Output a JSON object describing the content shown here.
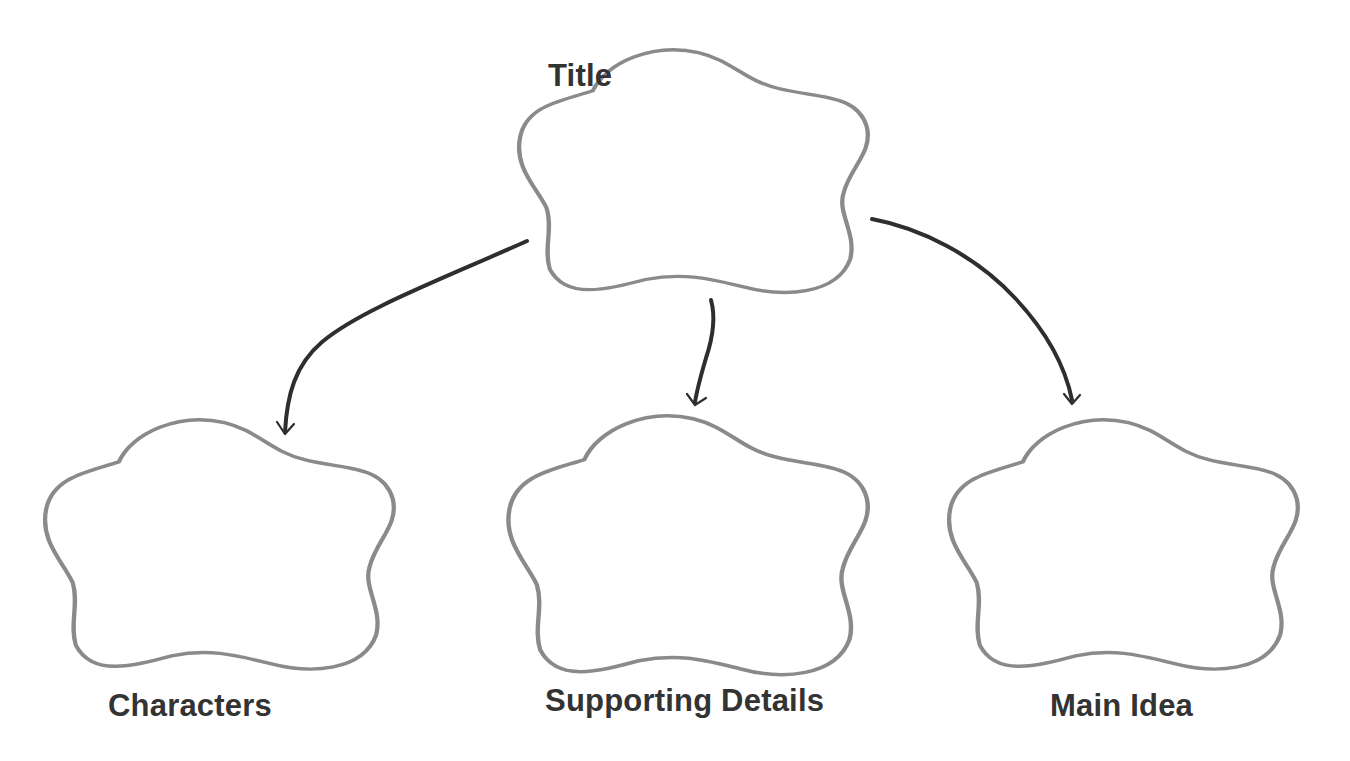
{
  "diagram": {
    "type": "graphic-organizer",
    "colors": {
      "background": "#ffffff",
      "cloud_outline": "#8a8a8a",
      "label_text": "#333333",
      "arrow": "#2e2e2e"
    },
    "nodes": [
      {
        "id": "title",
        "label": "Title",
        "shape": "cloud",
        "role": "root"
      },
      {
        "id": "characters",
        "label": "Characters",
        "shape": "cloud",
        "role": "child"
      },
      {
        "id": "supporting_details",
        "label": "Supporting Details",
        "shape": "cloud",
        "role": "child"
      },
      {
        "id": "main_idea",
        "label": "Main Idea",
        "shape": "cloud",
        "role": "child"
      }
    ],
    "edges": [
      {
        "from": "title",
        "to": "characters",
        "style": "curved-arrow"
      },
      {
        "from": "title",
        "to": "supporting_details",
        "style": "curved-arrow"
      },
      {
        "from": "title",
        "to": "main_idea",
        "style": "curved-arrow"
      }
    ]
  }
}
